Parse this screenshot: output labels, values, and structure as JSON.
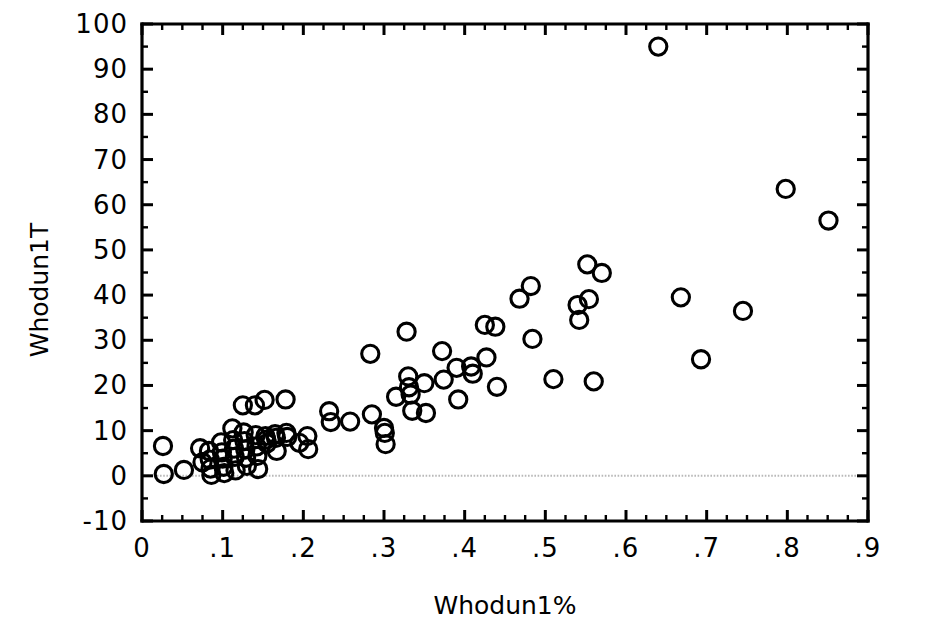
{
  "chart_data": {
    "type": "scatter",
    "title": "",
    "xlabel": "Whodun1%",
    "ylabel": "Whodun1T",
    "xlim": [
      0,
      0.9
    ],
    "ylim": [
      -10,
      100
    ],
    "grid": false,
    "legend": null,
    "marker": {
      "shape": "circle",
      "filled": false,
      "edge_color": "#000000",
      "size_px": 20
    },
    "reference_lines": [
      {
        "axis": "y",
        "value": 0,
        "style": "dotted",
        "color": "#b9b9b9"
      }
    ],
    "xticks": [
      0,
      0.1,
      0.2,
      0.3,
      0.4,
      0.5,
      0.6,
      0.7,
      0.8,
      0.9
    ],
    "xticklabels": [
      "0",
      ".1",
      ".2",
      ".3",
      ".4",
      ".5",
      ".6",
      ".7",
      ".8",
      ".9"
    ],
    "xminor_step": 0.025,
    "yticks": [
      -10,
      0,
      10,
      20,
      30,
      40,
      50,
      60,
      70,
      80,
      90,
      100
    ],
    "yticklabels": [
      "-10",
      "0",
      "10",
      "20",
      "30",
      "40",
      "50",
      "60",
      "70",
      "80",
      "90",
      "100"
    ],
    "yminor_step": 5,
    "points": [
      [
        0.026,
        6.6
      ],
      [
        0.027,
        0.4
      ],
      [
        0.052,
        1.3
      ],
      [
        0.072,
        6.1
      ],
      [
        0.075,
        3.0
      ],
      [
        0.083,
        5.5
      ],
      [
        0.084,
        3.6
      ],
      [
        0.085,
        1.6
      ],
      [
        0.086,
        0.2
      ],
      [
        0.098,
        7.4
      ],
      [
        0.099,
        5.2
      ],
      [
        0.1,
        3.8
      ],
      [
        0.101,
        2.0
      ],
      [
        0.102,
        0.6
      ],
      [
        0.112,
        10.5
      ],
      [
        0.113,
        7.9
      ],
      [
        0.114,
        6.0
      ],
      [
        0.115,
        4.2
      ],
      [
        0.116,
        1.2
      ],
      [
        0.125,
        15.6
      ],
      [
        0.126,
        9.6
      ],
      [
        0.127,
        7.7
      ],
      [
        0.128,
        5.8
      ],
      [
        0.129,
        4.0
      ],
      [
        0.13,
        2.2
      ],
      [
        0.14,
        15.6
      ],
      [
        0.141,
        9.0
      ],
      [
        0.142,
        6.5
      ],
      [
        0.143,
        4.4
      ],
      [
        0.144,
        1.5
      ],
      [
        0.152,
        16.8
      ],
      [
        0.153,
        8.8
      ],
      [
        0.154,
        8.0
      ],
      [
        0.155,
        7.2
      ],
      [
        0.165,
        9.2
      ],
      [
        0.166,
        8.4
      ],
      [
        0.167,
        5.5
      ],
      [
        0.178,
        16.9
      ],
      [
        0.179,
        9.5
      ],
      [
        0.18,
        8.6
      ],
      [
        0.195,
        7.3
      ],
      [
        0.205,
        8.8
      ],
      [
        0.206,
        5.9
      ],
      [
        0.232,
        14.3
      ],
      [
        0.234,
        11.9
      ],
      [
        0.258,
        12.0
      ],
      [
        0.283,
        27.0
      ],
      [
        0.285,
        13.6
      ],
      [
        0.3,
        10.6
      ],
      [
        0.301,
        9.5
      ],
      [
        0.302,
        7.0
      ],
      [
        0.315,
        17.5
      ],
      [
        0.328,
        31.9
      ],
      [
        0.33,
        22.0
      ],
      [
        0.331,
        19.6
      ],
      [
        0.333,
        18.0
      ],
      [
        0.335,
        14.4
      ],
      [
        0.35,
        20.5
      ],
      [
        0.352,
        13.9
      ],
      [
        0.372,
        27.6
      ],
      [
        0.374,
        21.3
      ],
      [
        0.39,
        23.9
      ],
      [
        0.392,
        16.9
      ],
      [
        0.408,
        24.2
      ],
      [
        0.41,
        22.6
      ],
      [
        0.425,
        33.4
      ],
      [
        0.427,
        26.2
      ],
      [
        0.438,
        33.0
      ],
      [
        0.44,
        19.7
      ],
      [
        0.468,
        39.2
      ],
      [
        0.482,
        42.0
      ],
      [
        0.484,
        30.3
      ],
      [
        0.51,
        21.4
      ],
      [
        0.54,
        37.8
      ],
      [
        0.542,
        34.5
      ],
      [
        0.552,
        46.8
      ],
      [
        0.554,
        39.1
      ],
      [
        0.56,
        20.9
      ],
      [
        0.57,
        44.9
      ],
      [
        0.64,
        95.0
      ],
      [
        0.668,
        39.5
      ],
      [
        0.693,
        25.8
      ],
      [
        0.745,
        36.5
      ],
      [
        0.798,
        63.5
      ],
      [
        0.851,
        56.5
      ]
    ]
  }
}
